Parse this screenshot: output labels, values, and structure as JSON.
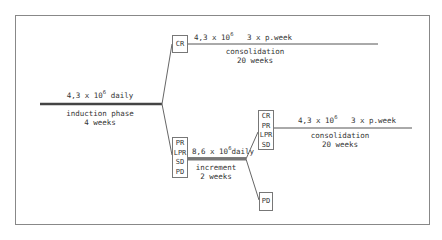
{
  "diagram": {
    "induction": {
      "dose": "4,3 x 10",
      "dose_exp": "6",
      "dose_freq": "daily",
      "phase": "induction phase",
      "duration": "4 weeks"
    },
    "branch_top": {
      "box": [
        "CR"
      ],
      "dose": "4,3 x 10",
      "dose_exp": "6",
      "dose_freq": "3 x p.week",
      "phase": "consolidation",
      "duration": "20 weeks"
    },
    "branch_bottom": {
      "box": [
        "PR",
        "LPR",
        "SD",
        "PD"
      ],
      "dose": "8,6 x 10",
      "dose_exp": "6",
      "dose_freq": "daily",
      "phase": "increment",
      "duration": "2 weeks"
    },
    "branch_increment_responders": {
      "box": [
        "CR",
        "PR",
        "LPR",
        "SD"
      ],
      "dose": "4,3 x 10",
      "dose_exp": "6",
      "dose_freq": "3 x p.week",
      "phase": "consolidation",
      "duration": "20 weeks"
    },
    "branch_increment_pd": {
      "box": [
        "PD"
      ]
    },
    "colors": {
      "line": "#555555",
      "border": "#888888",
      "text": "#333333"
    }
  }
}
